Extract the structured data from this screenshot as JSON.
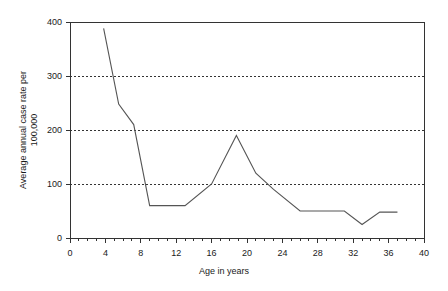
{
  "chart_data": {
    "type": "line",
    "title": "",
    "xlabel": "Age in years",
    "ylabel": "Average annual case rate per 100,000",
    "ylabel_line1": "Average annual case rate per",
    "ylabel_line2": "100,000",
    "xlim": [
      0,
      40
    ],
    "ylim": [
      0,
      400
    ],
    "xticks": [
      0,
      4,
      8,
      12,
      16,
      20,
      24,
      28,
      32,
      36,
      40
    ],
    "xtick_labels": [
      "0",
      "4",
      "8",
      "12",
      "16",
      "20",
      "24",
      "28",
      "32",
      "36",
      "40"
    ],
    "yticks": [
      0,
      100,
      200,
      300,
      400
    ],
    "ytick_labels": [
      "0",
      "100",
      "200",
      "300",
      "400"
    ],
    "x_minor_tick_step": 1,
    "grid": "horizontal-dotted",
    "gridlines_y": [
      100,
      200,
      300
    ],
    "legend": "none",
    "line_color": "#555555",
    "axis_color": "#333333",
    "grid_color": "#333333",
    "background": "#ffffff",
    "x": [
      3.8,
      5.5,
      7.2,
      9.0,
      13.0,
      16.0,
      18.8,
      21.0,
      23.0,
      26.0,
      31.0,
      33.0,
      35.0,
      37.0
    ],
    "y": [
      388,
      248,
      210,
      60,
      60,
      100,
      190,
      120,
      90,
      50,
      50,
      25,
      48,
      48
    ],
    "series": [
      {
        "name": "Average annual case rate",
        "points": [
          {
            "age": 3.8,
            "rate": 388
          },
          {
            "age": 5.5,
            "rate": 248
          },
          {
            "age": 7.2,
            "rate": 210
          },
          {
            "age": 9.0,
            "rate": 60
          },
          {
            "age": 13.0,
            "rate": 60
          },
          {
            "age": 16.0,
            "rate": 100
          },
          {
            "age": 18.8,
            "rate": 190
          },
          {
            "age": 21.0,
            "rate": 120
          },
          {
            "age": 23.0,
            "rate": 90
          },
          {
            "age": 26.0,
            "rate": 50
          },
          {
            "age": 31.0,
            "rate": 50
          },
          {
            "age": 33.0,
            "rate": 25
          },
          {
            "age": 35.0,
            "rate": 48
          },
          {
            "age": 37.0,
            "rate": 48
          }
        ]
      }
    ]
  }
}
